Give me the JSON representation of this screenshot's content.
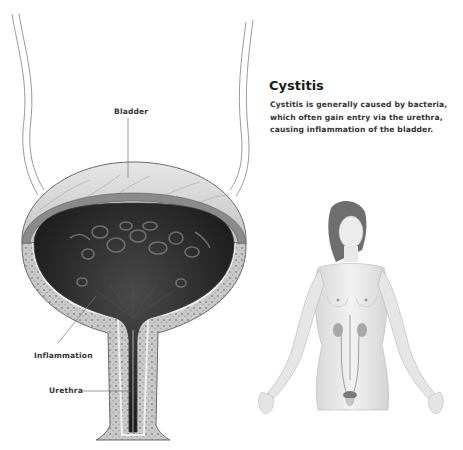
{
  "article": {
    "title": "Cystitis",
    "description": "Cystitis is generally caused by bacteria, which often gain entry via the urethra, causing inflammation of the bladder."
  },
  "bladder_diagram": {
    "labels": {
      "bladder": "Bladder",
      "inflammation": "Inflammation",
      "urethra": "Urethra"
    },
    "colors": {
      "interior": "#2a2a2a",
      "wall": "#b8b8b8",
      "outline": "#6a6a6a"
    }
  }
}
